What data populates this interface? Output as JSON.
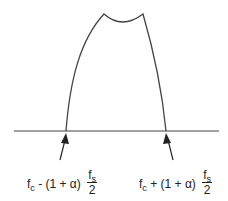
{
  "diagram": {
    "type": "spectrum",
    "colors": {
      "stroke": "#444444",
      "text": "#222222",
      "background": "#ffffff"
    },
    "left_label": {
      "base": "f",
      "base_sub": "c",
      "operator": "- (1 + α)",
      "frac_num_base": "f",
      "frac_num_sub": "s",
      "frac_den": "2"
    },
    "right_label": {
      "base": "f",
      "base_sub": "c",
      "operator": "+ (1 + α)",
      "frac_num_base": "f",
      "frac_num_sub": "s",
      "frac_den": "2"
    }
  }
}
